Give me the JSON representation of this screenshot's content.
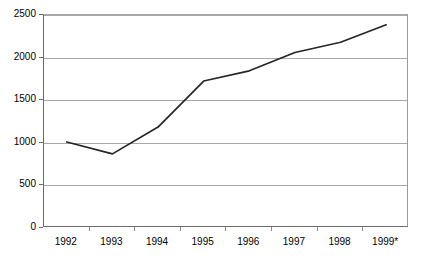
{
  "chart_data": {
    "type": "line",
    "title": "",
    "subtitle": "",
    "xlabel": "",
    "ylabel": "",
    "categories": [
      "1992",
      "1993",
      "1994",
      "1995",
      "1996",
      "1997",
      "1998",
      "1999*"
    ],
    "series": [
      {
        "name": "",
        "values": [
          1010,
          870,
          1185,
          1725,
          1845,
          2060,
          2180,
          2385
        ]
      }
    ],
    "ylim": [
      0,
      2500
    ],
    "y_ticks": [
      0,
      500,
      1000,
      1500,
      2000,
      2500
    ],
    "y_tick_labels": [
      "0",
      "500",
      "1000",
      "1500",
      "2000",
      "2500"
    ],
    "grid": true,
    "grid_axis": "y",
    "legend": false,
    "legend_position": "none",
    "annotations": [
      "* denotes estimated or provisional value for 1999"
    ],
    "colors": {
      "line": "#262626",
      "gridline": "#a8a8a8",
      "axis": "#6b6b6b",
      "text": "#000000",
      "background": "#ffffff"
    }
  }
}
